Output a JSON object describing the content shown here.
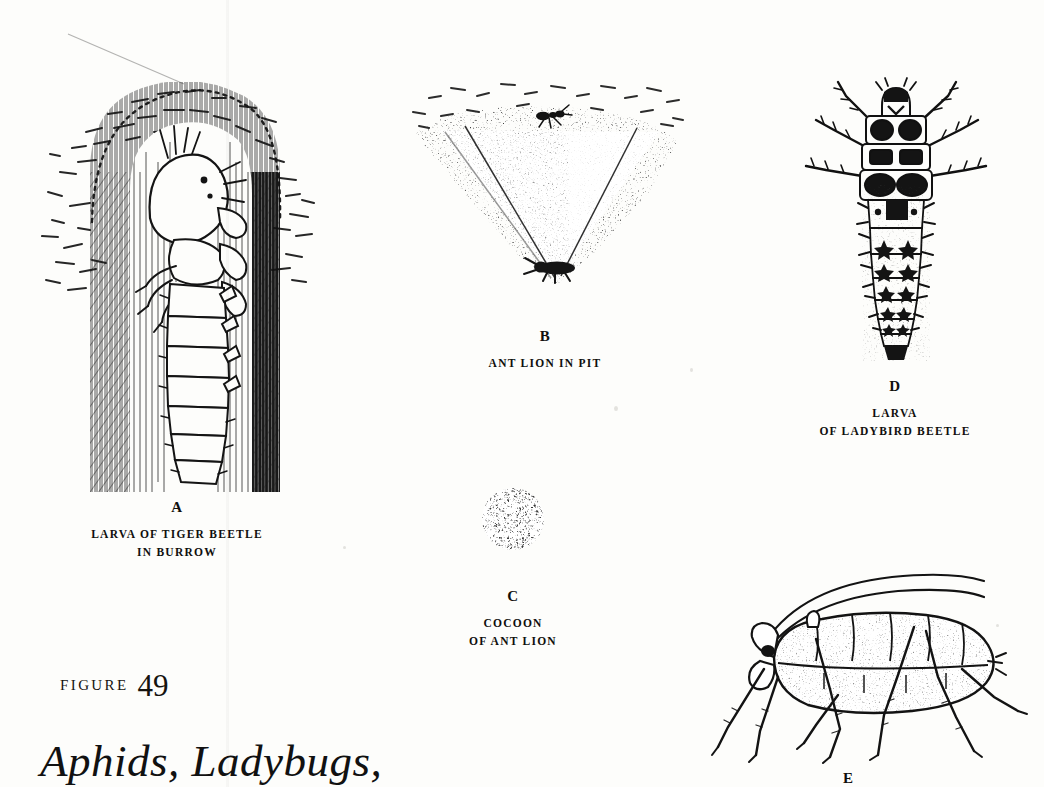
{
  "page": {
    "background_color": "#fdfdfb",
    "ink_color": "#111111",
    "kind": "book-plate-illustration"
  },
  "figure": {
    "label_word": "FIGURE",
    "number": "49",
    "title": "Aphids, Ladybugs,"
  },
  "panels": [
    {
      "id": "A",
      "letter": "A",
      "subject": "larva-of-tiger-beetle-in-burrow",
      "caption_lines": [
        "LARVA OF TIGER BEETLE",
        "IN BURROW"
      ]
    },
    {
      "id": "B",
      "letter": "B",
      "subject": "ant-lion-in-pit",
      "caption_lines": [
        "ANT LION IN PIT"
      ]
    },
    {
      "id": "C",
      "letter": "C",
      "subject": "cocoon-of-ant-lion",
      "caption_lines": [
        "COCOON",
        "OF ANT LION"
      ]
    },
    {
      "id": "D",
      "letter": "D",
      "subject": "larva-of-ladybird-beetle",
      "caption_lines": [
        "LARVA",
        "OF LADYBIRD BEETLE"
      ]
    },
    {
      "id": "E",
      "letter": "E",
      "subject": "aphid",
      "caption_lines": []
    }
  ]
}
